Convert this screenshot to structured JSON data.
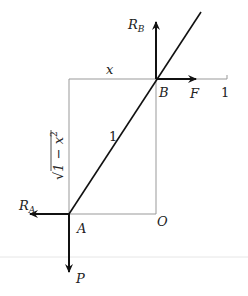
{
  "diagram": {
    "type": "statics free-body diagram (ladder against wall)",
    "colors": {
      "line": "#111111",
      "guide": "#999999",
      "faint": "#e6e6e6"
    },
    "points": {
      "A": {
        "label": "A",
        "x": 69,
        "y": 214
      },
      "B": {
        "label": "B",
        "x": 156,
        "y": 79
      },
      "O": {
        "label": "O",
        "x": 156,
        "y": 214
      }
    },
    "labels": {
      "x": "x",
      "one_axis": "1",
      "one_rod": "1",
      "sqrt_prefix": "√",
      "sqrt_body": "1 − x",
      "sqrt_exp": "2"
    },
    "forces": {
      "RB": {
        "main": "R",
        "sub": "B"
      },
      "F": {
        "main": "F"
      },
      "RA": {
        "main": "R",
        "sub": "A"
      },
      "P": {
        "main": "P"
      }
    }
  }
}
